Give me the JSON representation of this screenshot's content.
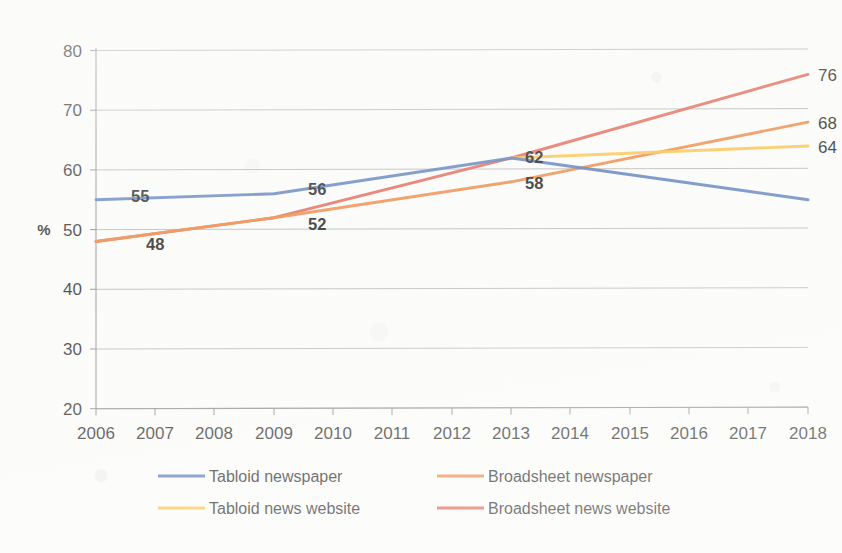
{
  "chart_data": {
    "type": "line",
    "title": "",
    "xlabel": "",
    "ylabel": "%",
    "ylim": [
      20,
      80
    ],
    "y_ticks": [
      20,
      30,
      40,
      50,
      60,
      70,
      80
    ],
    "grid": true,
    "legend_position": "bottom",
    "categories": [
      2006,
      2007,
      2008,
      2009,
      2010,
      2011,
      2012,
      2013,
      2014,
      2015,
      2016,
      2017,
      2018
    ],
    "x_tick_labels": [
      "2006",
      "2007",
      "2008",
      "2009",
      "2010",
      "2011",
      "2012",
      "2013",
      "2014",
      "2015",
      "2016",
      "2017",
      "2018"
    ],
    "series": [
      {
        "name": "Tabloid newspaper",
        "color": "#4A72B8",
        "x": [
          2006,
          2009,
          2013,
          2018
        ],
        "values": [
          55,
          56,
          62,
          55
        ]
      },
      {
        "name": "Broadsheet newspaper",
        "color": "#ED7D31",
        "x": [
          2006,
          2009,
          2013,
          2018
        ],
        "values": [
          48,
          52,
          58,
          68
        ]
      },
      {
        "name": "Tabloid news website",
        "color": "#FBC03C",
        "x": [
          2013,
          2018
        ],
        "values": [
          62,
          64
        ]
      },
      {
        "name": "Broadsheet news website",
        "color": "#E1553F",
        "x": [
          2006,
          2009,
          2013,
          2018
        ],
        "values": [
          48,
          52,
          62,
          76
        ]
      }
    ],
    "data_labels": [
      {
        "text": "55",
        "x": 2006,
        "y": 55,
        "series": "Tabloid newspaper"
      },
      {
        "text": "48",
        "x": 2006,
        "y": 48,
        "series": "Broadsheet newspaper"
      },
      {
        "text": "56",
        "x": 2009,
        "y": 56,
        "series": "Tabloid newspaper"
      },
      {
        "text": "52",
        "x": 2009,
        "y": 52,
        "series": "Broadsheet newspaper"
      },
      {
        "text": "62",
        "x": 2013,
        "y": 62,
        "series": "Tabloid newspaper"
      },
      {
        "text": "58",
        "x": 2013,
        "y": 58,
        "series": "Broadsheet newspaper"
      },
      {
        "text": "76",
        "x": 2018,
        "y": 76,
        "series": "Broadsheet news website"
      },
      {
        "text": "68",
        "x": 2018,
        "y": 68,
        "series": "Broadsheet newspaper"
      },
      {
        "text": "64",
        "x": 2018,
        "y": 64,
        "series": "Tabloid news website"
      },
      {
        "text": "55",
        "x": 2018,
        "y": 55,
        "series": "Tabloid newspaper"
      }
    ]
  },
  "axis": {
    "y_label": "%",
    "y_tick_80": "80",
    "y_tick_70": "70",
    "y_tick_60": "60",
    "y_tick_50": "50",
    "y_tick_40": "40",
    "y_tick_30": "30",
    "y_tick_20": "20",
    "x_ticks": [
      "2006",
      "2007",
      "2008",
      "2009",
      "2010",
      "2011",
      "2012",
      "2013",
      "2014",
      "2015",
      "2016",
      "2017",
      "2018"
    ]
  },
  "labels": {
    "v55a": "55",
    "v48": "48",
    "v56": "56",
    "v52": "52",
    "v62": "62",
    "v58": "58",
    "v76": "76",
    "v68": "68",
    "v64": "64",
    "v55b": "55"
  },
  "legend": {
    "items": [
      {
        "label": "Tabloid newspaper",
        "color": "#4A72B8"
      },
      {
        "label": "Broadsheet newspaper",
        "color": "#ED7D31"
      },
      {
        "label": "Tabloid news website",
        "color": "#FBC03C"
      },
      {
        "label": "Broadsheet news website",
        "color": "#E1553F"
      }
    ]
  }
}
